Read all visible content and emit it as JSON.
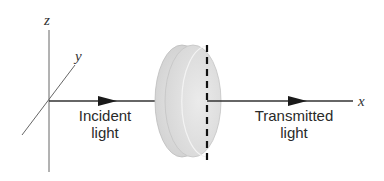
{
  "diagram": {
    "axes": {
      "x_label": "x",
      "y_label": "y",
      "z_label": "z"
    },
    "incident": {
      "line1": "Incident",
      "line2": "light"
    },
    "transmitted": {
      "line1": "Transmitted",
      "line2": "light"
    },
    "colors": {
      "axis": "#555555",
      "beam": "#2a2a2a",
      "disk_fill": "#d8d8d8",
      "disk_front": "#e2e2e2",
      "dashed": "#111111"
    }
  }
}
